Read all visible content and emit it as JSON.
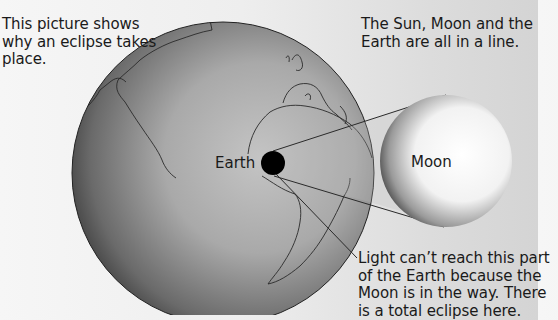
{
  "captions": {
    "top_left": "This picture shows why an eclipse takes place.",
    "top_right": "The Sun, Moon and the Earth are all in a line.",
    "bottom_right": "Light can’t reach this part of the Earth because the Moon is in the way. There is a total eclipse here."
  },
  "labels": {
    "earth": "Earth",
    "moon": "Moon"
  },
  "colors": {
    "background": "#eeeeee",
    "earth_light": "#bdbdbd",
    "earth_dark": "#3a3a3a",
    "moon_light": "#ffffff",
    "moon_dark": "#555555",
    "shadow": "#000000",
    "text": "#1a1a1a"
  }
}
